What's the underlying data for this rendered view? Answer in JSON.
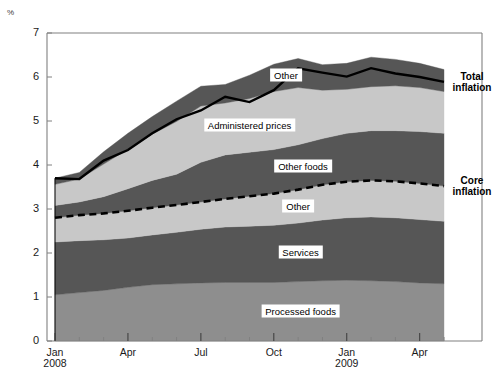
{
  "chart_data": {
    "type": "area",
    "title": "",
    "subtitle": "",
    "xlabel": "",
    "ylabel": "%",
    "ylim": [
      0,
      7
    ],
    "yticks": [
      0,
      1,
      2,
      3,
      4,
      5,
      6,
      7
    ],
    "ytick_labels": [
      "0",
      "1",
      "2",
      "3",
      "4",
      "5",
      "6",
      "7"
    ],
    "grid": false,
    "legend_position": "inline-labels",
    "stacked": true,
    "x": [
      "Jan 2008",
      "Feb 2008",
      "Mar 2008",
      "Apr 2008",
      "May 2008",
      "Jun 2008",
      "Jul 2008",
      "Aug 2008",
      "Sep 2008",
      "Oct 2008",
      "Nov 2008",
      "Dec 2008",
      "Jan 2009",
      "Feb 2009",
      "Mar 2009",
      "Apr 2009",
      "May 2009"
    ],
    "xtick_labels": [
      "Jan\n2008",
      "Apr",
      "Jul",
      "Oct",
      "Jan\n2009",
      "Apr"
    ],
    "xtick_indices": [
      0,
      3,
      6,
      9,
      12,
      15
    ],
    "series": [
      {
        "name": "Processed foods",
        "color": "#8e8e8e",
        "label_x_index": 10.1,
        "values": [
          1.05,
          1.1,
          1.15,
          1.22,
          1.28,
          1.3,
          1.32,
          1.33,
          1.33,
          1.33,
          1.35,
          1.37,
          1.38,
          1.37,
          1.35,
          1.32,
          1.3
        ]
      },
      {
        "name": "Services",
        "color": "#565656",
        "label_x_index": 10.1,
        "values": [
          1.2,
          1.18,
          1.15,
          1.12,
          1.13,
          1.17,
          1.22,
          1.26,
          1.28,
          1.3,
          1.33,
          1.38,
          1.42,
          1.45,
          1.45,
          1.44,
          1.42
        ]
      },
      {
        "name": "Other",
        "color": "#c8c8c8",
        "label_x_index": 10.0,
        "values": [
          0.55,
          0.58,
          0.6,
          0.62,
          0.62,
          0.62,
          0.62,
          0.64,
          0.68,
          0.72,
          0.76,
          0.8,
          0.82,
          0.83,
          0.83,
          0.82,
          0.8
        ]
      },
      {
        "name": "Other foods",
        "color": "#565656",
        "label_x_index": 10.2,
        "values": [
          0.28,
          0.3,
          0.38,
          0.5,
          0.62,
          0.7,
          0.9,
          1.0,
          1.0,
          1.0,
          1.02,
          1.05,
          1.1,
          1.13,
          1.15,
          1.18,
          1.2
        ]
      },
      {
        "name": "Administered prices",
        "color": "#c8c8c8",
        "label_x_index": 8.0,
        "values": [
          0.48,
          0.52,
          0.74,
          0.9,
          1.05,
          1.2,
          1.28,
          1.18,
          1.22,
          1.32,
          1.3,
          1.1,
          1.0,
          1.0,
          1.02,
          1.0,
          0.95
        ]
      },
      {
        "name": "Other",
        "color": "#565656",
        "label_x_index": 9.5,
        "values": [
          0.14,
          0.15,
          0.28,
          0.36,
          0.4,
          0.46,
          0.45,
          0.42,
          0.53,
          0.62,
          0.66,
          0.58,
          0.59,
          0.67,
          0.6,
          0.55,
          0.5
        ]
      }
    ],
    "core_inflation": {
      "name": "Core inflation",
      "style": "dashed-black",
      "values": [
        2.8,
        2.86,
        2.9,
        2.96,
        3.03,
        3.09,
        3.16,
        3.23,
        3.29,
        3.35,
        3.44,
        3.55,
        3.62,
        3.65,
        3.63,
        3.58,
        3.52
      ]
    },
    "total_inflation": {
      "name": "Total inflation",
      "style": "solid-black",
      "values": [
        3.7,
        3.68,
        4.1,
        4.34,
        4.72,
        5.04,
        5.24,
        5.55,
        5.43,
        5.7,
        6.2,
        6.1,
        6.01,
        6.2,
        6.08,
        6.0,
        5.89
      ]
    },
    "edge_labels": [
      {
        "name": "Total inflation",
        "text": "Total\ninflation",
        "value": 5.89
      },
      {
        "name": "Core inflation",
        "text": "Core\ninflation",
        "value": 3.52
      }
    ]
  },
  "colors": {
    "axis": "#808080",
    "line": "#000000",
    "band_light": "#c8c8c8",
    "band_mid": "#8e8e8e",
    "band_dark": "#565656",
    "text": "#1a1a1a"
  }
}
